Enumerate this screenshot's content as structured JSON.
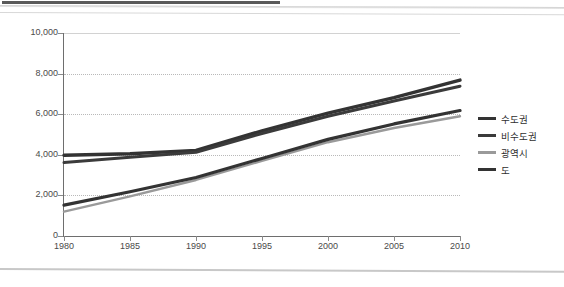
{
  "page": {
    "corner_mark": "",
    "top_bar_present": true
  },
  "legend": {
    "position": "right",
    "items": [
      {
        "label": "수도권",
        "color": "#333333",
        "width": 3.4
      },
      {
        "label": "비수도권",
        "color": "#3b3b3b",
        "width": 3.0
      },
      {
        "label": "광역시",
        "color": "#9a9a9a",
        "width": 2.4
      },
      {
        "label": "도",
        "color": "#333333",
        "width": 3.4
      }
    ]
  },
  "chart_data": {
    "type": "line",
    "title": "",
    "subtitle": "",
    "xlabel": "",
    "ylabel": "",
    "x": [
      1980,
      1985,
      1990,
      1995,
      2000,
      2005,
      2010
    ],
    "xtick_labels": [
      "1980",
      "1985",
      "1990",
      "1995",
      "2000",
      "2005",
      "2010"
    ],
    "ytick_labels": [
      "0",
      "2,000",
      "4,000",
      "6,000",
      "8,000",
      "10,000"
    ],
    "yticks": [
      0,
      2000,
      4000,
      6000,
      8000,
      10000
    ],
    "xlim": [
      1980,
      2010
    ],
    "ylim": [
      0,
      10000
    ],
    "grid": true,
    "grid_axis": "y",
    "legend_position": "right",
    "series": [
      {
        "name": "수도권",
        "color": "#333333",
        "width": 3.4,
        "values": [
          3980,
          4050,
          4220,
          5180,
          6050,
          6820,
          7680
        ]
      },
      {
        "name": "비수도권",
        "color": "#3b3b3b",
        "width": 3.0,
        "values": [
          3620,
          3880,
          4120,
          5050,
          5900,
          6650,
          7380
        ]
      },
      {
        "name": "광역시",
        "color": "#9a9a9a",
        "width": 2.4,
        "values": [
          1200,
          1950,
          2760,
          3700,
          4620,
          5320,
          5900
        ]
      },
      {
        "name": "도",
        "color": "#333333",
        "width": 3.2,
        "values": [
          1520,
          2180,
          2880,
          3820,
          4760,
          5520,
          6180
        ]
      }
    ]
  }
}
